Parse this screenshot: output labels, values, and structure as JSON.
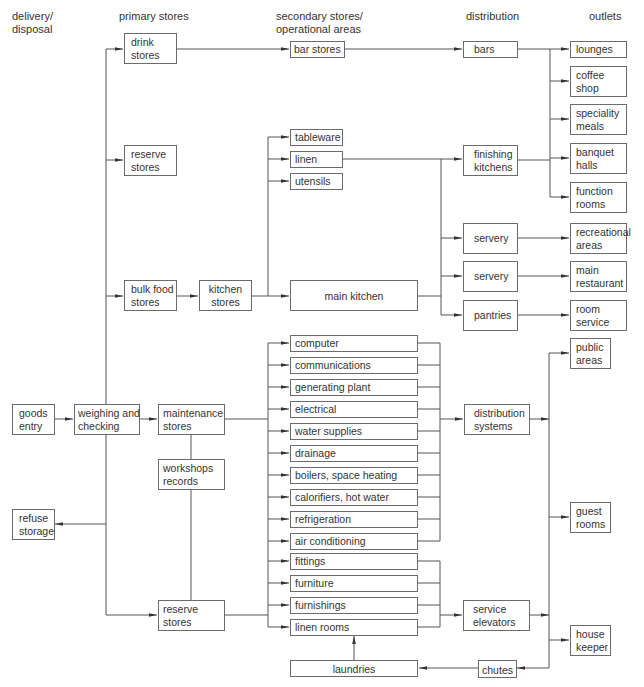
{
  "diagram": {
    "column_headers": {
      "delivery": "delivery/\ndisposal",
      "primary": "primary stores",
      "secondary": "secondary stores/\noperational areas",
      "distribution": "distribution",
      "outlets": "outlets"
    },
    "nodes": {
      "goods_entry": "goods\nentry",
      "refuse_storage": "refuse\nstorage",
      "weighing_checking": "weighing and\nchecking",
      "drink_stores": "drink\nstores",
      "reserve_stores_top": "reserve\nstores",
      "bulk_food_stores": "bulk food\nstores",
      "kitchen_stores": "kitchen\nstores",
      "maintenance_stores": "maintenance\nstores",
      "workshops_records": "workshops\nrecords",
      "reserve_stores_bottom": "reserve\nstores",
      "bar_stores": "bar stores",
      "tableware": "tableware",
      "linen": "linen",
      "utensils": "utensils",
      "main_kitchen": "main kitchen",
      "services": [
        "computer",
        "communications",
        "generating plant",
        "electrical",
        "water supplies",
        "drainage",
        "boilers, space heating",
        "calorifiers, hot water",
        "refrigeration",
        "air conditioning"
      ],
      "furnishing_items": [
        "fittings",
        "furniture",
        "furnishings",
        "linen rooms"
      ],
      "laundries": "laundries",
      "bars": "bars",
      "finishing_kitchens": "finishing\nkitchens",
      "servery_1": "servery",
      "servery_2": "servery",
      "pantries": "pantries",
      "distribution_systems": "distribution\nsystems",
      "service_elevators": "service\nelevators",
      "chutes": "chutes",
      "lounges": "lounges",
      "coffee_shop": "coffee\nshop",
      "speciality_meals": "speciality\nmeals",
      "banquet_halls": "banquet\nhalls",
      "function_rooms": "function\nrooms",
      "recreational_areas": "recreational\nareas",
      "main_restaurant": "main\nrestaurant",
      "room_service": "room\nservice",
      "public_areas": "public\nareas",
      "guest_rooms": "guest\nrooms",
      "house_keeper": "house\nkeeper"
    }
  }
}
